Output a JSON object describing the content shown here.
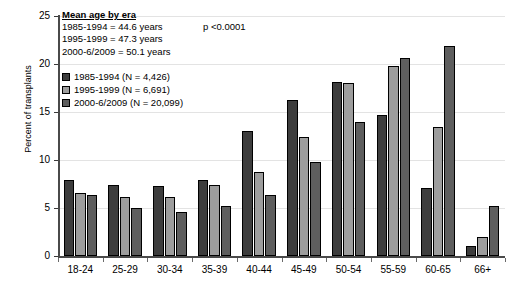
{
  "chart_data": {
    "type": "bar",
    "title": "",
    "xlabel": "",
    "ylabel": "Percent of transplants",
    "ylim": [
      0,
      25
    ],
    "yticks": [
      0,
      5,
      10,
      15,
      20,
      25
    ],
    "grid": true,
    "legend_position": "top-left",
    "categories": [
      "18-24",
      "25-29",
      "30-34",
      "35-39",
      "40-44",
      "45-49",
      "50-54",
      "55-59",
      "60-65",
      "66+"
    ],
    "series": [
      {
        "name": "1985-1994 (N = 4,426)",
        "color": "#3d3d3d",
        "values": [
          7.9,
          7.4,
          7.3,
          7.9,
          13.0,
          16.2,
          18.1,
          14.7,
          7.1,
          1.0
        ]
      },
      {
        "name": "1995-1999 (N = 6,691)",
        "color": "#9d9d9d",
        "values": [
          6.6,
          6.1,
          6.1,
          7.4,
          8.8,
          12.4,
          18.0,
          19.8,
          13.4,
          2.0
        ]
      },
      {
        "name": "2000-6/2009 (N = 20,099)",
        "color": "#5e5e5e",
        "values": [
          6.4,
          5.0,
          4.6,
          5.2,
          6.4,
          9.8,
          14.0,
          20.6,
          21.9,
          5.2
        ]
      }
    ],
    "annotations": {
      "heading": "Mean age by era",
      "rows": [
        "1985-1994 = 44.6 years",
        "1995-1999 = 47.3 years",
        "2000-6/2009 = 50.1 years"
      ],
      "pvalue": "p <0.0001"
    }
  }
}
